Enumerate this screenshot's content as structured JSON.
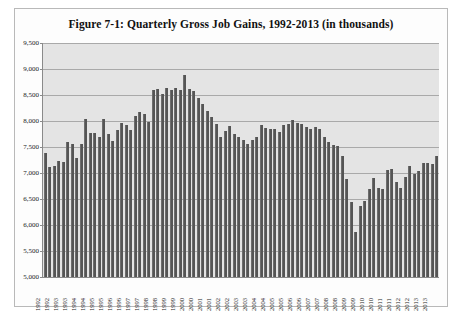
{
  "figure": {
    "title": "Figure 7-1: Quarterly Gross Job Gains, 1992-2013 (in thousands)"
  },
  "style": {
    "bar_color": "#555555",
    "plot_background": "#e4e4e4",
    "gridline_color": "#a9a9a9",
    "axis_color": "#8a8a8a",
    "frame_border": "#b9b9b9",
    "page_background": "#ffffff"
  },
  "chart_data": {
    "type": "bar",
    "title": "Figure 7-1: Quarterly Gross Job Gains, 1992-2013 (in thousands)",
    "xlabel": "",
    "ylabel": "",
    "ylim": [
      5000,
      9500
    ],
    "ytick_values": [
      5000,
      5500,
      6000,
      6500,
      7000,
      7500,
      8000,
      8500,
      9000,
      9500
    ],
    "ytick_labels": [
      "5,000",
      "5,500",
      "6,000",
      "6,500",
      "7,000",
      "7,500",
      "8,000",
      "8,500",
      "9,000",
      "9,500"
    ],
    "grid": true,
    "legend": false,
    "xtick_labels": [
      "1992",
      "1992",
      "1993",
      "1993",
      "1994",
      "1994",
      "1995",
      "1995",
      "1996",
      "1996",
      "1997",
      "1997",
      "1998",
      "1998",
      "1999",
      "1999",
      "2000",
      "2000",
      "2001",
      "2001",
      "2002",
      "2002",
      "2003",
      "2003",
      "2004",
      "2004",
      "2005",
      "2005",
      "2006",
      "2006",
      "2007",
      "2007",
      "2008",
      "2008",
      "2009",
      "2009",
      "2010",
      "2010",
      "2011",
      "2011",
      "2012",
      "2012",
      "2013",
      "2013"
    ],
    "categories": [
      "1992 Q1",
      "1992 Q2",
      "1992 Q3",
      "1992 Q4",
      "1993 Q1",
      "1993 Q2",
      "1993 Q3",
      "1993 Q4",
      "1994 Q1",
      "1994 Q2",
      "1994 Q3",
      "1994 Q4",
      "1995 Q1",
      "1995 Q2",
      "1995 Q3",
      "1995 Q4",
      "1996 Q1",
      "1996 Q2",
      "1996 Q3",
      "1996 Q4",
      "1997 Q1",
      "1997 Q2",
      "1997 Q3",
      "1997 Q4",
      "1998 Q1",
      "1998 Q2",
      "1998 Q3",
      "1998 Q4",
      "1999 Q1",
      "1999 Q2",
      "1999 Q3",
      "1999 Q4",
      "2000 Q1",
      "2000 Q2",
      "2000 Q3",
      "2000 Q4",
      "2001 Q1",
      "2001 Q2",
      "2001 Q3",
      "2001 Q4",
      "2002 Q1",
      "2002 Q2",
      "2002 Q3",
      "2002 Q4",
      "2003 Q1",
      "2003 Q2",
      "2003 Q3",
      "2003 Q4",
      "2004 Q1",
      "2004 Q2",
      "2004 Q3",
      "2004 Q4",
      "2005 Q1",
      "2005 Q2",
      "2005 Q3",
      "2005 Q4",
      "2006 Q1",
      "2006 Q2",
      "2006 Q3",
      "2006 Q4",
      "2007 Q1",
      "2007 Q2",
      "2007 Q3",
      "2007 Q4",
      "2008 Q1",
      "2008 Q2",
      "2008 Q3",
      "2008 Q4",
      "2009 Q1",
      "2009 Q2",
      "2009 Q3",
      "2009 Q4",
      "2010 Q1",
      "2010 Q2",
      "2010 Q3",
      "2010 Q4",
      "2011 Q1",
      "2011 Q2",
      "2011 Q3",
      "2011 Q4",
      "2012 Q1",
      "2012 Q2",
      "2012 Q3",
      "2012 Q4",
      "2013 Q1",
      "2013 Q2",
      "2013 Q3",
      "2013 Q4"
    ],
    "values": [
      7380,
      7120,
      7130,
      7230,
      7220,
      7600,
      7560,
      7290,
      7560,
      8030,
      7760,
      7760,
      7700,
      8030,
      7750,
      7620,
      7820,
      7960,
      7930,
      7820,
      8090,
      8170,
      8130,
      7980,
      8600,
      8610,
      8520,
      8640,
      8600,
      8640,
      8590,
      8880,
      8610,
      8580,
      8440,
      8330,
      8200,
      8080,
      7950,
      7700,
      7800,
      7900,
      7750,
      7690,
      7630,
      7550,
      7640,
      7690,
      7930,
      7860,
      7850,
      7840,
      7780,
      7920,
      7950,
      8010,
      7960,
      7950,
      7880,
      7840,
      7880,
      7840,
      7690,
      7600,
      7540,
      7520,
      7320,
      6880,
      6440,
      5860,
      6370,
      6460,
      6700,
      6910,
      6710,
      6700,
      7060,
      7070,
      6830,
      6720,
      6930,
      7130,
      6990,
      7040,
      7190,
      7200,
      7180,
      7330
    ]
  }
}
